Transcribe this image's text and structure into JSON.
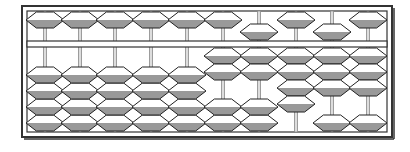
{
  "diagram": {
    "type": "soroban-abacus",
    "rod_count": 10,
    "upper_beads_per_rod": 1,
    "lower_beads_per_rod": 4,
    "rods": [
      {
        "index": 1,
        "upper_down": false,
        "lower_up": 0,
        "value": 0
      },
      {
        "index": 2,
        "upper_down": false,
        "lower_up": 0,
        "value": 0
      },
      {
        "index": 3,
        "upper_down": false,
        "lower_up": 0,
        "value": 0
      },
      {
        "index": 4,
        "upper_down": false,
        "lower_up": 0,
        "value": 0
      },
      {
        "index": 5,
        "upper_down": false,
        "lower_up": 0,
        "value": 0
      },
      {
        "index": 6,
        "upper_down": false,
        "lower_up": 2,
        "value": 2
      },
      {
        "index": 7,
        "upper_down": true,
        "lower_up": 2,
        "value": 7
      },
      {
        "index": 8,
        "upper_down": false,
        "lower_up": 4,
        "value": 4
      },
      {
        "index": 9,
        "upper_down": true,
        "lower_up": 3,
        "value": 8
      },
      {
        "index": 10,
        "upper_down": false,
        "lower_up": 3,
        "value": 3
      }
    ],
    "represented_number": "27483"
  },
  "colors": {
    "frame": "#333333",
    "rod": "#888888",
    "bead_top": "#ffffff",
    "bead_bottom": "#999999",
    "bead_stroke": "#222222",
    "background": "#ffffff"
  }
}
